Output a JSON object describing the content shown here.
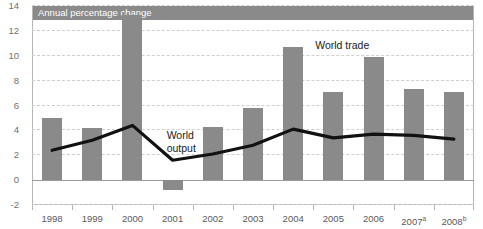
{
  "figure": {
    "top_caption": "",
    "band_label": "Annual percentage change"
  },
  "axes": {
    "y_ticks": [
      "14",
      "12",
      "10",
      "8",
      "6",
      "4",
      "2",
      "0",
      "-2"
    ],
    "x_ticks": [
      {
        "label": "1998",
        "note": ""
      },
      {
        "label": "1999",
        "note": ""
      },
      {
        "label": "2000",
        "note": ""
      },
      {
        "label": "2001",
        "note": ""
      },
      {
        "label": "2002",
        "note": ""
      },
      {
        "label": "2003",
        "note": ""
      },
      {
        "label": "2004",
        "note": ""
      },
      {
        "label": "2005",
        "note": ""
      },
      {
        "label": "2006",
        "note": ""
      },
      {
        "label": "2007",
        "note": "a"
      },
      {
        "label": "2008",
        "note": "b"
      }
    ]
  },
  "annotations": {
    "world_trade": "World trade",
    "world_output": "World output"
  },
  "colors": {
    "bar": "#8a8a8a",
    "line": "#111111",
    "band": "#8a8a8a",
    "grid": "#cfcfcf",
    "axis": "#b5b5b5"
  },
  "chart_data": {
    "type": "bar",
    "title": "Annual percentage change",
    "xlabel": "",
    "ylabel": "Annual percentage change",
    "ylim": [
      -2,
      14
    ],
    "ytick_step": 2,
    "grid": true,
    "legend": "inline annotations",
    "categories": [
      "1998",
      "1999",
      "2000",
      "2001",
      "2002",
      "2003",
      "2004",
      "2005",
      "2006",
      "2007",
      "2008"
    ],
    "series": [
      {
        "name": "World trade",
        "type": "bar",
        "values": [
          5.0,
          4.2,
          13.3,
          -0.8,
          4.3,
          5.8,
          10.7,
          7.1,
          9.9,
          7.3,
          7.1
        ]
      },
      {
        "name": "World output",
        "type": "line",
        "values": [
          2.4,
          3.2,
          4.4,
          1.6,
          2.1,
          2.8,
          4.1,
          3.4,
          3.7,
          3.6,
          3.3
        ]
      }
    ],
    "notes": [
      "a",
      "b"
    ]
  }
}
